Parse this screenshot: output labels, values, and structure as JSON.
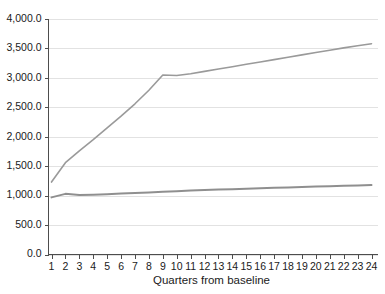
{
  "chart_data": {
    "type": "line",
    "title": "",
    "xlabel": "Quarters from baseline",
    "ylabel": "",
    "xlim": [
      1,
      24
    ],
    "ylim": [
      0,
      4000
    ],
    "grid": true,
    "legend": "none",
    "x": [
      1,
      2,
      3,
      4,
      5,
      6,
      7,
      8,
      9,
      10,
      11,
      12,
      13,
      14,
      15,
      16,
      17,
      18,
      19,
      20,
      21,
      22,
      23,
      24
    ],
    "xtick_labels": [
      "1",
      "2",
      "3",
      "4",
      "5",
      "6",
      "7",
      "8",
      "9",
      "10",
      "11",
      "12",
      "13",
      "14",
      "15",
      "16",
      "17",
      "18",
      "19",
      "20",
      "21",
      "22",
      "23",
      "24"
    ],
    "ytick_values": [
      0,
      500,
      1000,
      1500,
      2000,
      2500,
      3000,
      3500,
      4000
    ],
    "ytick_labels": [
      "0.0",
      "500.0",
      "1,000.0",
      "1,500.0",
      "2,000.0",
      "2,500.0",
      "3,000.0",
      "3,500.0",
      "4,000.0"
    ],
    "series": [
      {
        "name": "upper-series",
        "color": "#9a9a9a",
        "width": 1.6,
        "values": [
          1230,
          1560,
          1760,
          1950,
          2150,
          2350,
          2560,
          2790,
          3050,
          3040,
          3070,
          3110,
          3150,
          3190,
          3230,
          3270,
          3310,
          3350,
          3390,
          3430,
          3470,
          3510,
          3545,
          3580
        ]
      },
      {
        "name": "lower-series",
        "color": "#8f8f8f",
        "width": 2.0,
        "values": [
          970,
          1030,
          1010,
          1015,
          1025,
          1035,
          1045,
          1055,
          1065,
          1075,
          1085,
          1095,
          1103,
          1110,
          1118,
          1125,
          1132,
          1140,
          1147,
          1155,
          1160,
          1166,
          1172,
          1180
        ]
      }
    ]
  },
  "axes": {
    "x_title": "Quarters from baseline"
  },
  "colors": {
    "grid": "#e2e2e2",
    "axis": "#4d4d4d",
    "text": "#1a1a1a",
    "background": "#ffffff"
  }
}
